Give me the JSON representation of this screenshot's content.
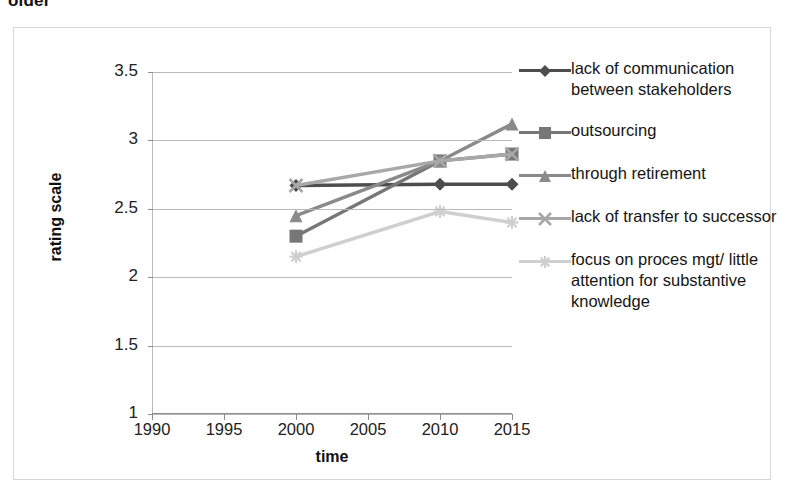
{
  "page": {
    "partial_text_above": "older"
  },
  "chart_data": {
    "type": "line",
    "title": "",
    "xlabel": "time",
    "ylabel": "rating scale",
    "x": [
      2000,
      2010,
      2015
    ],
    "xticks": [
      1990,
      1995,
      2000,
      2005,
      2010,
      2015
    ],
    "xlim": [
      1990,
      2015
    ],
    "yticks": [
      1,
      1.5,
      2,
      2.5,
      3,
      3.5
    ],
    "ylim": [
      1,
      3.5
    ],
    "grid": true,
    "legend_position": "right",
    "series": [
      {
        "name": "lack of communication between stakeholders",
        "marker": "diamond",
        "color": "#4d4d4d",
        "values": [
          2.67,
          2.68,
          2.68
        ]
      },
      {
        "name": "outsourcing",
        "marker": "square",
        "color": "#777777",
        "values": [
          2.3,
          2.85,
          2.9
        ]
      },
      {
        "name": "through retirement",
        "marker": "triangle",
        "color": "#8a8a8a",
        "values": [
          2.45,
          2.85,
          3.12
        ]
      },
      {
        "name": "lack of transfer to successor",
        "marker": "x-cross",
        "color": "#a8a8a8",
        "values": [
          2.67,
          2.85,
          2.9
        ]
      },
      {
        "name": "focus on proces mgt/ little attention for substantive knowledge",
        "marker": "star",
        "color": "#cfcfcf",
        "values": [
          2.15,
          2.48,
          2.4
        ]
      }
    ]
  },
  "legend": {
    "items": [
      {
        "label": "lack of communication between stakeholders",
        "marker": "diamond-marker-icon",
        "color": "#4d4d4d"
      },
      {
        "label": "outsourcing",
        "marker": "square-marker-icon",
        "color": "#777777"
      },
      {
        "label": "through retirement",
        "marker": "triangle-marker-icon",
        "color": "#8a8a8a"
      },
      {
        "label": "lack of transfer to successor",
        "marker": "x-cross-marker-icon",
        "color": "#a8a8a8"
      },
      {
        "label": "focus on proces mgt/ little attention for substantive knowledge",
        "marker": "star-marker-icon",
        "color": "#cfcfcf"
      }
    ]
  }
}
